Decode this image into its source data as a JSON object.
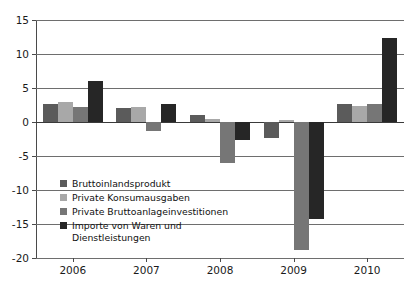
{
  "chart_data": {
    "type": "bar",
    "title": "",
    "xlabel": "",
    "ylabel": "",
    "categories": [
      "2006",
      "2007",
      "2008",
      "2009",
      "2010"
    ],
    "ylim": [
      -20,
      15
    ],
    "yticks": [
      15,
      10,
      5,
      0,
      -5,
      -10,
      -15,
      -20
    ],
    "ytick_labels": [
      "15",
      "10",
      "5",
      "0",
      "-5",
      "-10",
      "-15",
      "-20"
    ],
    "grid": true,
    "legend_position": "inside-lower-left",
    "series": [
      {
        "name": "Bruttoinlandsprodukt",
        "color": "#5b5b5b",
        "values": [
          2.7,
          2.1,
          1.0,
          -2.3,
          2.7
        ]
      },
      {
        "name": "Private Konsumausgaben",
        "color": "#a8a8a8",
        "values": [
          2.9,
          2.2,
          0.5,
          0.3,
          2.3
        ]
      },
      {
        "name": "Private Bruttoanlageinvestitionen",
        "color": "#767676",
        "values": [
          2.2,
          -1.3,
          -6.1,
          -18.8,
          2.6
        ]
      },
      {
        "name": "Importe von Waren und\nDienstleistungen",
        "color": "#262626",
        "values": [
          6.0,
          2.6,
          -2.7,
          -14.3,
          12.4
        ]
      }
    ]
  },
  "legend": {
    "items": [
      {
        "label": "Bruttoinlandsprodukt",
        "color": "#5b5b5b"
      },
      {
        "label": "Private Konsumausgaben",
        "color": "#a8a8a8"
      },
      {
        "label": "Private Bruttoanlageinvestitionen",
        "color": "#767676"
      },
      {
        "label": "Importe von Waren und\nDienstleistungen",
        "color": "#262626"
      }
    ]
  }
}
